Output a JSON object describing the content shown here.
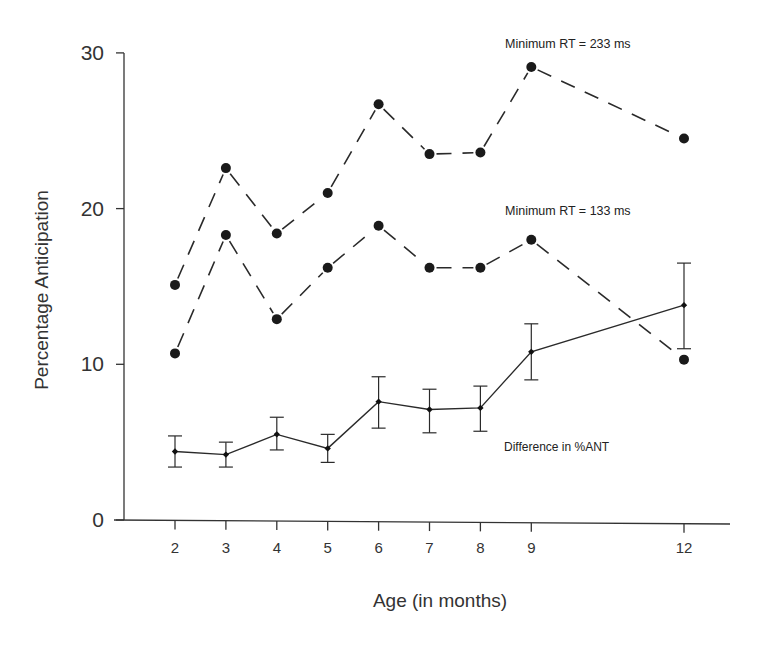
{
  "chart_data": {
    "type": "line",
    "title": "",
    "xlabel": "Age (in months)",
    "ylabel": "Percentage Anticipation",
    "x": [
      2,
      3,
      4,
      5,
      6,
      7,
      8,
      9,
      12
    ],
    "x_tick_labels": [
      "2",
      "3",
      "4",
      "5",
      "6",
      "7",
      "8",
      "9",
      "12"
    ],
    "y_tick_labels": [
      "0",
      "10",
      "20",
      "30"
    ],
    "ylim": [
      0,
      30
    ],
    "grid": false,
    "legend": "inline annotations",
    "series": [
      {
        "name": "Minimum RT = 233 ms",
        "style": "dashed line, large filled circles",
        "values": [
          15.1,
          22.6,
          18.4,
          21.0,
          26.7,
          23.5,
          23.6,
          29.1,
          24.5
        ]
      },
      {
        "name": "Minimum RT = 133 ms",
        "style": "dashed line, large filled circles",
        "values": [
          10.7,
          18.3,
          12.9,
          16.2,
          18.9,
          16.2,
          16.2,
          18.0,
          10.3
        ]
      },
      {
        "name": "Difference in %ANT",
        "style": "solid line, small diamonds, error bars",
        "values": [
          4.4,
          4.2,
          5.5,
          4.6,
          7.6,
          7.1,
          7.2,
          10.8,
          13.8
        ],
        "error_low": [
          3.4,
          3.4,
          4.5,
          3.7,
          5.9,
          5.6,
          5.7,
          9.0,
          11.0
        ],
        "error_high": [
          5.4,
          5.0,
          6.6,
          5.5,
          9.2,
          8.4,
          8.6,
          12.6,
          16.5
        ]
      }
    ],
    "annotations": [
      {
        "text": "Minimum RT = 233 ms",
        "near_series": 0
      },
      {
        "text": "Minimum RT = 133 ms",
        "near_series": 1
      },
      {
        "text": "Difference in %ANT",
        "near_series": 2
      }
    ]
  },
  "labels": {
    "ylabel": "Percentage Anticipation",
    "xlabel": "Age (in months)",
    "ann_233": "Minimum RT = 233 ms",
    "ann_133": "Minimum RT = 133 ms",
    "ann_diff": "Difference in %ANT"
  },
  "colors": {
    "ink": "#2a2a2a",
    "background": "#ffffff"
  }
}
